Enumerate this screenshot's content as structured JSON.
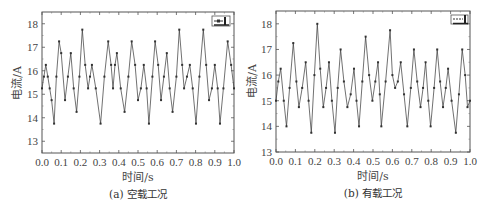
{
  "chart_data": [
    {
      "id": "a",
      "type": "line",
      "caption": "(a) 空载工况",
      "title": "",
      "xlabel": "时间/s",
      "ylabel": "电流/A",
      "xlim": [
        0.0,
        1.0
      ],
      "ylim": [
        12.5,
        18.5
      ],
      "xticks": [
        "0.0",
        "0.1",
        "0.2",
        "0.3",
        "0.4",
        "0.5",
        "0.6",
        "0.7",
        "0.8",
        "0.9",
        "1.0"
      ],
      "yticks": [
        "13",
        "14",
        "15",
        "16",
        "17",
        "18"
      ],
      "ytick_values": [
        13,
        14,
        15,
        16,
        17,
        18
      ],
      "legend": {
        "entries": [
          "—■— I"
        ],
        "position": "upper right"
      },
      "grid": false,
      "series": [
        {
          "name": "I",
          "color": "#333333",
          "marker": "square",
          "x": [
            0.0,
            0.01,
            0.02,
            0.03,
            0.04,
            0.05,
            0.063,
            0.075,
            0.089,
            0.1,
            0.12,
            0.135,
            0.15,
            0.165,
            0.18,
            0.195,
            0.21,
            0.225,
            0.24,
            0.25,
            0.26,
            0.28,
            0.305,
            0.325,
            0.345,
            0.36,
            0.37,
            0.38,
            0.39,
            0.41,
            0.43,
            0.45,
            0.467,
            0.485,
            0.5,
            0.515,
            0.53,
            0.545,
            0.557,
            0.575,
            0.589,
            0.605,
            0.62,
            0.635,
            0.65,
            0.665,
            0.68,
            0.7,
            0.715,
            0.73,
            0.74,
            0.755,
            0.77,
            0.785,
            0.802,
            0.82,
            0.84,
            0.855,
            0.87,
            0.885,
            0.9,
            0.915,
            0.927,
            0.945,
            0.967,
            0.985,
            1.0
          ],
          "y": [
            15.25,
            15.75,
            16.25,
            15.75,
            15.25,
            14.75,
            13.75,
            15.75,
            17.25,
            16.75,
            14.75,
            15.75,
            16.75,
            15.25,
            14.25,
            15.75,
            17.75,
            16.25,
            15.25,
            15.75,
            16.25,
            15.25,
            13.75,
            15.75,
            17.25,
            16.25,
            15.25,
            16.25,
            16.75,
            15.25,
            14.25,
            15.75,
            17.25,
            16.25,
            14.75,
            15.25,
            16.25,
            15.25,
            13.75,
            15.75,
            17.25,
            16.25,
            14.75,
            15.75,
            16.75,
            15.25,
            14.25,
            15.75,
            17.75,
            16.25,
            15.25,
            15.75,
            16.25,
            15.25,
            13.75,
            15.75,
            17.75,
            16.25,
            14.75,
            15.25,
            16.25,
            15.25,
            13.75,
            15.25,
            17.25,
            16.25,
            15.25
          ]
        }
      ]
    },
    {
      "id": "b",
      "type": "line",
      "caption": "(b) 有载工况",
      "title": "",
      "xlabel": "时间/s",
      "ylabel": "电流/A",
      "xlim": [
        0.0,
        1.0
      ],
      "ylim": [
        13.0,
        18.5
      ],
      "xticks": [
        "0.0",
        "0.1",
        "0.2",
        "0.3",
        "0.4",
        "0.5",
        "0.6",
        "0.7",
        "0.8",
        "0.9",
        "1.0"
      ],
      "yticks": [
        "13",
        "14",
        "15",
        "16",
        "17",
        "18"
      ],
      "ytick_values": [
        13,
        14,
        15,
        16,
        17,
        18
      ],
      "legend": {
        "entries": [
          "—■— I"
        ],
        "position": "upper right"
      },
      "grid": false,
      "series": [
        {
          "name": "I",
          "color": "#333333",
          "marker": "square",
          "x": [
            0.0,
            0.012,
            0.024,
            0.04,
            0.054,
            0.07,
            0.089,
            0.105,
            0.118,
            0.135,
            0.153,
            0.168,
            0.182,
            0.198,
            0.213,
            0.228,
            0.244,
            0.258,
            0.273,
            0.288,
            0.304,
            0.318,
            0.333,
            0.35,
            0.368,
            0.385,
            0.402,
            0.415,
            0.428,
            0.445,
            0.462,
            0.48,
            0.497,
            0.512,
            0.526,
            0.535,
            0.543,
            0.565,
            0.588,
            0.6,
            0.614,
            0.628,
            0.643,
            0.66,
            0.677,
            0.695,
            0.711,
            0.728,
            0.745,
            0.758,
            0.771,
            0.785,
            0.797,
            0.815,
            0.831,
            0.846,
            0.861,
            0.875,
            0.887,
            0.905,
            0.927,
            0.943,
            0.96,
            0.975,
            0.987,
            1.0
          ],
          "y": [
            15.0,
            15.75,
            16.25,
            15.0,
            14.0,
            15.5,
            17.25,
            15.75,
            14.75,
            15.5,
            16.5,
            15.0,
            13.75,
            16.0,
            18.0,
            16.25,
            14.75,
            15.5,
            16.5,
            15.0,
            13.75,
            15.5,
            17.0,
            15.75,
            14.75,
            15.25,
            16.25,
            15.0,
            14.0,
            15.75,
            17.5,
            16.0,
            15.0,
            15.75,
            16.5,
            15.25,
            14.0,
            15.75,
            17.75,
            16.0,
            15.5,
            15.75,
            16.5,
            15.25,
            14.0,
            15.5,
            17.0,
            15.75,
            14.75,
            15.5,
            16.5,
            15.0,
            14.0,
            15.5,
            17.0,
            15.75,
            14.75,
            15.5,
            16.25,
            15.0,
            13.75,
            15.25,
            17.0,
            16.0,
            14.75,
            15.0
          ]
        }
      ]
    }
  ]
}
